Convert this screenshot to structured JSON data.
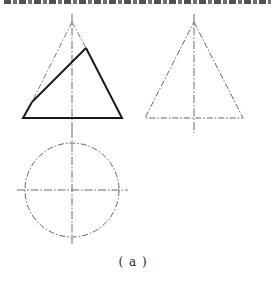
{
  "figure": {
    "caption": "( a )",
    "views": {
      "front_view": {
        "description": "cone front view with inclined cutting plane",
        "apex": [
          72,
          22
        ],
        "base_left": [
          23,
          118
        ],
        "base_right": [
          122,
          118
        ],
        "cut_line": [
          [
            86,
            48
          ],
          [
            32,
            102
          ]
        ],
        "centerline": [
          [
            72,
            14
          ],
          [
            72,
            130
          ]
        ]
      },
      "side_view": {
        "description": "cone side view (phantom outline)",
        "apex": [
          194,
          22
        ],
        "base_left": [
          145,
          118
        ],
        "base_right": [
          243,
          118
        ],
        "centerline": [
          [
            194,
            14
          ],
          [
            194,
            133
          ]
        ]
      },
      "top_view": {
        "description": "cone top view circle",
        "center": [
          72,
          190
        ],
        "radius": 47,
        "h_centerline": [
          [
            17,
            190
          ],
          [
            128,
            190
          ]
        ],
        "v_centerline": [
          [
            72,
            130
          ],
          [
            72,
            244
          ]
        ]
      }
    },
    "colors": {
      "line": "#222222",
      "thin_line": "#444444",
      "background": "#ffffff"
    }
  }
}
